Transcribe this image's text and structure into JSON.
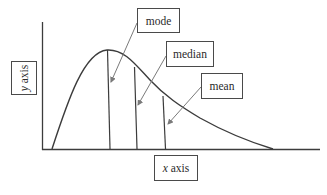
{
  "diagram": {
    "labels": {
      "mode": "mode",
      "median": "median",
      "mean": "mean",
      "x_axis_var": "x",
      "x_axis_word": " axis",
      "y_axis_var": "y",
      "y_axis_word": " axis"
    },
    "colors": {
      "line": "#3c3c3c",
      "arrow": "#7a7a7a",
      "box_border": "#4a4a4a",
      "background": "#ffffff"
    },
    "curve": "right-skewed distribution",
    "order_left_to_right": [
      "mode",
      "median",
      "mean"
    ]
  }
}
